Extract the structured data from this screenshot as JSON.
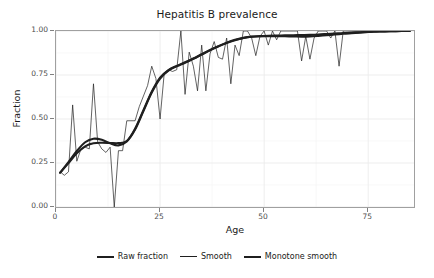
{
  "chart_data": {
    "type": "line",
    "title": "Hepatitis B prevalence",
    "xlabel": "Age",
    "ylabel": "Fraction",
    "xlim": [
      0,
      86
    ],
    "ylim": [
      0.0,
      1.0
    ],
    "xticks": [
      0,
      25,
      50,
      75
    ],
    "xtick_labels": [
      "0",
      "25",
      "50",
      "75"
    ],
    "yticks": [
      0.0,
      0.25,
      0.5,
      0.75,
      1.0
    ],
    "ytick_labels": [
      "0.00",
      "0.25",
      "0.50",
      "0.75",
      "1.00"
    ],
    "grid": true,
    "legend_position": "bottom",
    "legend_entries": [
      "Raw fraction",
      "Smooth",
      "Monotone smooth"
    ],
    "series": [
      {
        "name": "Raw fraction",
        "style": "thin-step",
        "x": [
          1,
          2,
          3,
          4,
          5,
          6,
          7,
          8,
          9,
          10,
          11,
          12,
          13,
          14,
          15,
          16,
          17,
          18,
          19,
          20,
          21,
          22,
          23,
          24,
          25,
          26,
          27,
          28,
          29,
          30,
          31,
          32,
          33,
          34,
          35,
          36,
          37,
          38,
          39,
          40,
          41,
          42,
          43,
          44,
          45,
          46,
          47,
          48,
          49,
          50,
          51,
          52,
          53,
          54,
          55,
          56,
          57,
          58,
          59,
          60,
          61,
          62,
          63,
          64,
          65,
          66,
          67,
          68,
          69,
          70,
          71,
          72,
          73,
          74,
          75,
          76,
          77,
          78,
          79,
          80,
          81,
          82,
          83,
          84,
          85
        ],
        "y": [
          0.2,
          0.18,
          0.2,
          0.58,
          0.26,
          0.33,
          0.34,
          0.33,
          0.7,
          0.37,
          0.33,
          0.31,
          0.34,
          0.0,
          0.32,
          0.32,
          0.49,
          0.49,
          0.49,
          0.57,
          0.63,
          0.69,
          0.8,
          0.73,
          0.5,
          0.76,
          0.78,
          0.77,
          0.78,
          1.0,
          0.64,
          0.88,
          0.8,
          0.66,
          0.92,
          0.66,
          0.87,
          0.94,
          0.85,
          0.84,
          0.96,
          0.7,
          0.92,
          0.86,
          1.0,
          1.0,
          0.96,
          0.86,
          0.97,
          1.0,
          0.92,
          1.0,
          0.95,
          1.0,
          1.0,
          1.0,
          1.0,
          1.0,
          0.83,
          0.97,
          0.84,
          0.96,
          1.0,
          1.0,
          1.0,
          0.96,
          1.0,
          0.8,
          1.0,
          1.0,
          1.0,
          1.0,
          1.0,
          1.0,
          1.0,
          1.0,
          1.0,
          1.0,
          1.0,
          1.0,
          1.0,
          1.0,
          1.0,
          1.0,
          1.0
        ]
      },
      {
        "name": "Smooth",
        "style": "thick-curve",
        "x": [
          1,
          3,
          5,
          7,
          9,
          11,
          13,
          15,
          17,
          19,
          21,
          23,
          25,
          27,
          29,
          31,
          33,
          35,
          37,
          39,
          41,
          43,
          45,
          47,
          49,
          51,
          53,
          55,
          57,
          59,
          61,
          63,
          65,
          67,
          69,
          71,
          73,
          75,
          77,
          79,
          81,
          83,
          85
        ],
        "y": [
          0.195,
          0.255,
          0.318,
          0.368,
          0.388,
          0.382,
          0.362,
          0.35,
          0.372,
          0.44,
          0.545,
          0.65,
          0.73,
          0.775,
          0.8,
          0.82,
          0.842,
          0.866,
          0.89,
          0.912,
          0.932,
          0.948,
          0.96,
          0.967,
          0.97,
          0.971,
          0.971,
          0.97,
          0.969,
          0.968,
          0.969,
          0.972,
          0.976,
          0.98,
          0.984,
          0.988,
          0.991,
          0.994,
          0.996,
          0.998,
          0.999,
          1.0,
          1.0
        ]
      },
      {
        "name": "Monotone smooth",
        "style": "thick-curve",
        "x": [
          1,
          3,
          5,
          7,
          9,
          11,
          13,
          15,
          17,
          19,
          21,
          23,
          25,
          27,
          29,
          31,
          33,
          35,
          37,
          39,
          41,
          43,
          45,
          47,
          49,
          51,
          53,
          55,
          57,
          59,
          61,
          63,
          65,
          67,
          69,
          71,
          73,
          75,
          77,
          79,
          81,
          83,
          85
        ],
        "y": [
          0.195,
          0.25,
          0.305,
          0.345,
          0.362,
          0.365,
          0.364,
          0.363,
          0.375,
          0.445,
          0.55,
          0.655,
          0.735,
          0.778,
          0.802,
          0.822,
          0.844,
          0.868,
          0.892,
          0.914,
          0.934,
          0.95,
          0.961,
          0.968,
          0.971,
          0.973,
          0.974,
          0.975,
          0.976,
          0.977,
          0.978,
          0.98,
          0.983,
          0.986,
          0.989,
          0.991,
          0.993,
          0.995,
          0.997,
          0.998,
          0.999,
          1.0,
          1.0
        ]
      }
    ]
  },
  "colors": {
    "line": "#1f1f1f",
    "panel_border": "#a0a0a0",
    "grid_major": "#ebebeb",
    "grid_minor": "#f5f5f5",
    "tick_text": "#4d4d4d",
    "title_text": "#1a1a1a",
    "background": "#ffffff"
  }
}
